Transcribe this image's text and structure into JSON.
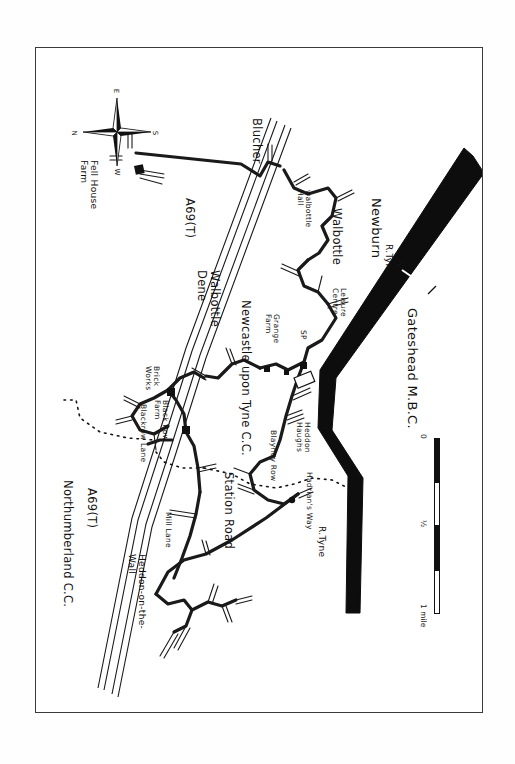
{
  "document": {
    "type": "hand-drawn sketch map",
    "orientation_note": "map drawn rotated 90 degrees clockwise; labels read bottom-to-top"
  },
  "compass": {
    "name": "compass-rose",
    "directions": {
      "north": "N",
      "east": "E",
      "south": "S",
      "west": "W"
    }
  },
  "scale_bar": {
    "zero": "0",
    "half": "½",
    "one": "1 mile"
  },
  "labels": {
    "fell_house_farm": "Fell House\nFarm",
    "blucher": "Blucher",
    "a69_top": "A69(T)",
    "a69_bottom": "A69(T)",
    "walbottle_hall": "walbottle\nHall",
    "walbottle": "Walbottle",
    "newburn": "Newburn",
    "walbottle_dene": "Walbottle\nDene",
    "newcastle_upon_tyne_cc": "Newcastle upon Tyne C.C.",
    "northumberland_cc": "Northumberland C.C.",
    "gateshead_mbc": "Gateshead M.B.C.",
    "r_tyne_upper": "R.Tyne",
    "r_tyne_lower": "R.Tyne",
    "leisure_centre": "Leisure\nCentre",
    "grange_farm": "Grange\nFarm",
    "sp": "SP",
    "blayney_row": "Blayney Row",
    "heddon_haughs": "Heddon\nHaughs",
    "hadrians_way": "Hadrian's Way",
    "station_road": "Station Road",
    "brick_works": "Brick\nWorks",
    "black_row_farm": "Black Row\nFarm",
    "blackrow_lane": "Blackrow Lane",
    "mill_lane": "Mill Lane",
    "heddon_on_the_wall": "Heddon-on-the-\nWall"
  },
  "colors": {
    "ink": "#111111",
    "paper": "#ffffff",
    "frame": "#3a3a3a",
    "river": "#0d0d0d"
  }
}
